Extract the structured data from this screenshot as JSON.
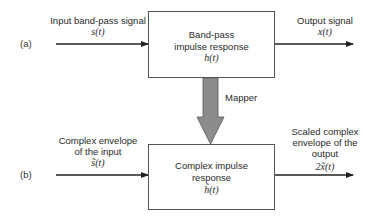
{
  "diagram": {
    "part_a": {
      "tag": "(a)",
      "input": {
        "label": "Input band-pass signal",
        "symbol": "s(t)"
      },
      "block": {
        "line1": "Band-pass",
        "line2": "impulse response",
        "symbol": "h(t)"
      },
      "output": {
        "label": "Output signal",
        "symbol": "x(t)"
      }
    },
    "mapper": {
      "label": "Mapper"
    },
    "part_b": {
      "tag": "(b)",
      "input": {
        "line1": "Complex envelope",
        "line2": "of the input",
        "symbol": "s̃(t)"
      },
      "block": {
        "line1": "Complex impulse",
        "line2": "response",
        "symbol": "h̃(t)"
      },
      "output": {
        "line1": "Scaled complex",
        "line2": "envelope of the",
        "line3": "output",
        "symbol": "2x̃(t)"
      }
    },
    "colors": {
      "line": "#222222",
      "box_border": "#555555",
      "mapper_fill": "#8c8c8c",
      "mapper_border": "#555555"
    }
  }
}
